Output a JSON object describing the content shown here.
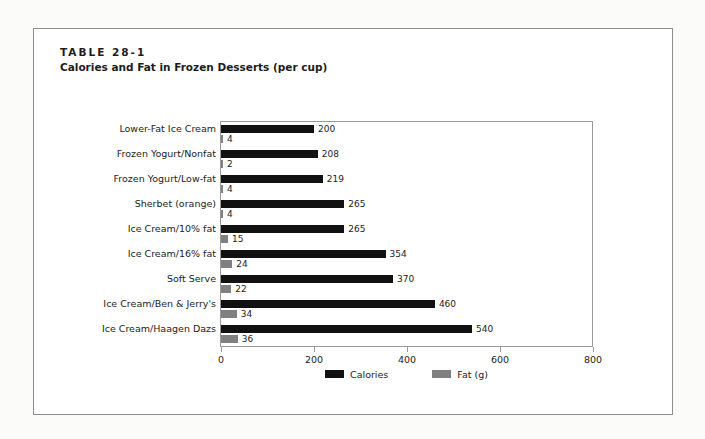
{
  "table": {
    "label": "TABLE 28-1",
    "title": "Calories and Fat in Frozen Desserts (per cup)"
  },
  "legend": {
    "calories": {
      "label": "Calories",
      "color": "#111111"
    },
    "fat": {
      "label": "Fat (g)",
      "color": "#808080"
    }
  },
  "axis": {
    "ticks": [
      "0",
      "200",
      "400",
      "600",
      "800"
    ]
  },
  "chart_data": {
    "type": "bar",
    "orientation": "horizontal",
    "title": "Calories (kcal) and fat (gm)/cup, vanilla flavor",
    "xlabel": "",
    "ylabel": "",
    "xlim": [
      0,
      800
    ],
    "xticks": [
      0,
      200,
      400,
      600,
      800
    ],
    "grid": false,
    "legend_position": "bottom-center",
    "categories": [
      "Lower-Fat Ice Cream",
      "Frozen Yogurt/Nonfat",
      "Frozen Yogurt/Low-fat",
      "Sherbet (orange)",
      "Ice Cream/10% fat",
      "Ice Cream/16% fat",
      "Soft Serve",
      "Ice Cream/Ben & Jerry's",
      "Ice Cream/Haagen Dazs"
    ],
    "series": [
      {
        "name": "Calories",
        "color": "#111111",
        "values": [
          200,
          208,
          219,
          265,
          265,
          354,
          370,
          460,
          540
        ]
      },
      {
        "name": "Fat (g)",
        "color": "#808080",
        "values": [
          4,
          2,
          4,
          4,
          15,
          24,
          22,
          34,
          36
        ]
      }
    ]
  }
}
